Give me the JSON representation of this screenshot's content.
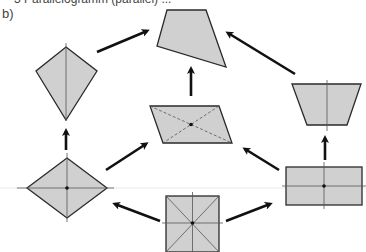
{
  "header": {
    "clipped_text": "3   Parallelogramm (parallel) ...",
    "part_label": "b)"
  },
  "colors": {
    "fill": "#d0d0d0",
    "stroke": "#2a2a2a",
    "arrow": "#111111",
    "helper_line": "#555555"
  },
  "shapes": [
    {
      "name": "general-quadrilateral",
      "position": "top-center"
    },
    {
      "name": "kite",
      "position": "upper-left"
    },
    {
      "name": "isosceles-trapezoid",
      "position": "upper-right"
    },
    {
      "name": "parallelogram",
      "position": "center"
    },
    {
      "name": "rhombus",
      "position": "lower-left"
    },
    {
      "name": "rectangle",
      "position": "lower-right"
    },
    {
      "name": "square",
      "position": "bottom-center"
    }
  ],
  "arrows": [
    {
      "from": "square",
      "to": "rhombus"
    },
    {
      "from": "square",
      "to": "rectangle"
    },
    {
      "from": "rhombus",
      "to": "kite"
    },
    {
      "from": "rhombus",
      "to": "parallelogram"
    },
    {
      "from": "rectangle",
      "to": "parallelogram"
    },
    {
      "from": "rectangle",
      "to": "isosceles-trapezoid"
    },
    {
      "from": "kite",
      "to": "general-quadrilateral"
    },
    {
      "from": "parallelogram",
      "to": "general-quadrilateral"
    },
    {
      "from": "isosceles-trapezoid",
      "to": "general-quadrilateral"
    }
  ]
}
